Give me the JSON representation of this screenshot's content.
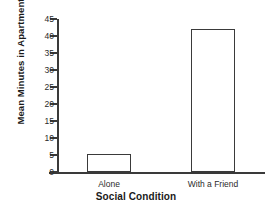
{
  "chart_data": {
    "type": "bar",
    "title": "",
    "xlabel": "Social Condition",
    "ylabel": "Mean Minutes in Apartment",
    "categories": [
      "Alone",
      "With a Friend"
    ],
    "values": [
      5.3,
      42
    ],
    "series": [
      {
        "name": "Mean Minutes in Apartment",
        "values": [
          5.3,
          42
        ]
      }
    ],
    "ylim": [
      0,
      45
    ],
    "yticks": [
      0,
      5,
      10,
      15,
      20,
      25,
      30,
      35,
      40,
      45
    ],
    "ytick_labels": [
      "0",
      "5",
      "10",
      "15",
      "20",
      "25",
      "30",
      "35",
      "40",
      "45"
    ],
    "grid": false,
    "legend": "none",
    "bar_fill_color": "#ffffff",
    "bar_edge_color": "#3a3a3a",
    "axis_color": "#3a3a3a",
    "text_color": "#1a1a1a",
    "background_color": "#ffffff"
  }
}
